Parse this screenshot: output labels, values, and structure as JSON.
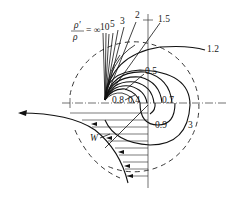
{
  "diagram": {
    "ratio_label": {
      "numerator": "ρ'",
      "denominator": "ρ",
      "equals": "= ∞"
    },
    "curve_labels": {
      "top": [
        "10",
        "5",
        "3",
        "2",
        "1.5"
      ],
      "right": "1.2",
      "inner": [
        "0.5",
        "0.8",
        "0.4",
        "0.7",
        "0.9",
        "3"
      ]
    },
    "velocity_label": "W"
  }
}
